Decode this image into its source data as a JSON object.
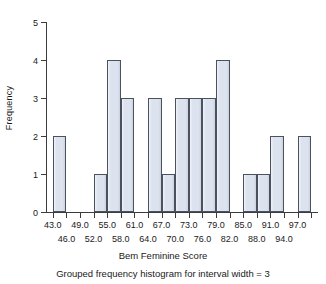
{
  "chart_data": {
    "type": "bar",
    "title": "",
    "subtitle": "Grouped frequency histogram for interval width = 3",
    "xlabel": "Bem Feminine Score",
    "ylabel": "Frequency",
    "grid": false,
    "legend": null,
    "bin_width": 3,
    "xlim": [
      41.5,
      101.5
    ],
    "ylim": [
      0,
      5
    ],
    "yticks": [
      "0",
      "1",
      "2",
      "3",
      "4",
      "5"
    ],
    "ytick_values": [
      0,
      1,
      2,
      3,
      4,
      5
    ],
    "xtick_labels_row1": [
      "43.0",
      "49.0",
      "55.0",
      "61.0",
      "67.0",
      "73.0",
      "79.0",
      "85.0",
      "91.0",
      "97.0"
    ],
    "xtick_labels_row2": [
      "46.0",
      "52.0",
      "58.0",
      "64.0",
      "70.0",
      "76.0",
      "82.0",
      "88.0",
      "94.0"
    ],
    "xtick_values_row1": [
      43.0,
      49.0,
      55.0,
      61.0,
      67.0,
      73.0,
      79.0,
      85.0,
      91.0,
      97.0
    ],
    "xtick_values_row2": [
      46.0,
      52.0,
      58.0,
      64.0,
      70.0,
      76.0,
      82.0,
      88.0,
      94.0
    ],
    "xtick_values_all": [
      43.0,
      46.0,
      49.0,
      52.0,
      55.0,
      58.0,
      61.0,
      64.0,
      67.0,
      70.0,
      73.0,
      76.0,
      79.0,
      82.0,
      85.0,
      88.0,
      91.0,
      94.0,
      97.0,
      100.0
    ],
    "bin_starts": [
      43,
      46,
      49,
      52,
      55,
      58,
      61,
      64,
      67,
      70,
      73,
      76,
      79,
      82,
      85,
      88,
      91,
      94,
      97
    ],
    "bin_ends": [
      46,
      49,
      52,
      55,
      58,
      61,
      64,
      67,
      70,
      73,
      76,
      79,
      82,
      85,
      88,
      91,
      94,
      97,
      100
    ],
    "categories": [
      "43-46",
      "46-49",
      "49-52",
      "52-55",
      "55-58",
      "58-61",
      "61-64",
      "64-67",
      "67-70",
      "70-73",
      "73-76",
      "76-79",
      "79-82",
      "82-85",
      "85-88",
      "88-91",
      "91-94",
      "94-97",
      "97-100"
    ],
    "values": [
      2,
      0,
      0,
      1,
      4,
      3,
      0,
      3,
      1,
      3,
      3,
      3,
      4,
      0,
      1,
      1,
      2,
      0,
      2
    ],
    "bar_fill_color": "#dde3ee",
    "bar_edge_color": "#4a5260",
    "axis_color": "#3c3c3c",
    "background_color": "#ffffff"
  },
  "figure": {
    "ylabel": "Frequency",
    "xlabel": "Bem Feminine Score",
    "caption": "Grouped frequency histogram for interval width = 3"
  }
}
